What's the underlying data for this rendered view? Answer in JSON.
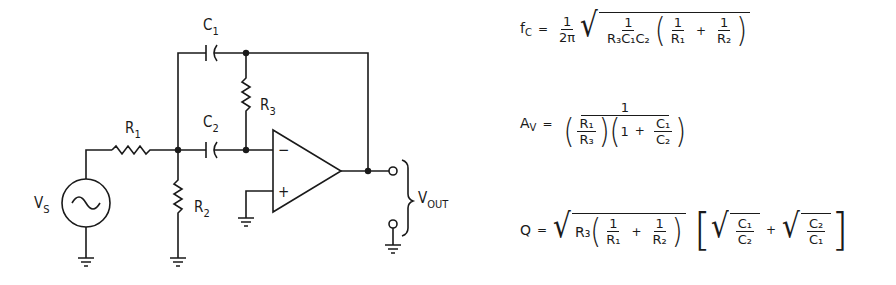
{
  "circuit": {
    "title": "Multiple-feedback band-pass filter",
    "components": {
      "source": {
        "label": "V",
        "sub": "S"
      },
      "r1": {
        "label": "R",
        "sub": "1"
      },
      "r2": {
        "label": "R",
        "sub": "2"
      },
      "r3": {
        "label": "R",
        "sub": "3"
      },
      "c1": {
        "label": "C",
        "sub": "1"
      },
      "c2": {
        "label": "C",
        "sub": "2"
      },
      "opamp_inv": "−",
      "opamp_noninv": "+",
      "output": {
        "label": "V",
        "sub": "OUT"
      }
    }
  },
  "equations": {
    "fc": {
      "lhs": "f",
      "lhs_sub": "C",
      "eq": "=",
      "coef_num": "1",
      "coef_den": "2π",
      "inner_num": "1",
      "inner_den": "R₃C₁C₂",
      "p_num1": "1",
      "p_den1": "R₁",
      "plus": "+",
      "p_num2": "1",
      "p_den2": "R₂"
    },
    "av": {
      "lhs": "A",
      "lhs_sub": "V",
      "eq": "=",
      "num": "1",
      "d1_num": "R₁",
      "d1_den": "R₃",
      "one": "1",
      "plus": "+",
      "d2_num": "C₁",
      "d2_den": "C₂"
    },
    "q": {
      "lhs": "Q",
      "eq": "=",
      "r3": "R₃",
      "p_num1": "1",
      "p_den1": "R₁",
      "plus": "+",
      "p_num2": "1",
      "p_den2": "R₂",
      "s1_num": "C₁",
      "s1_den": "C₂",
      "plus2": "+",
      "s2_num": "C₂",
      "s2_den": "C₁"
    }
  }
}
